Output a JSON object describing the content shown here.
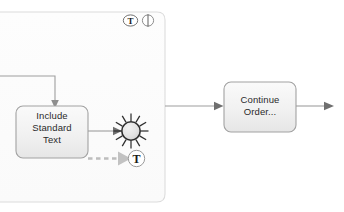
{
  "diagram": {
    "type": "workflow-bpmn",
    "background_color": "#ffffff",
    "container": {
      "name": "subprocess-container",
      "fill": "#fcfcfc",
      "stroke": "#d8d8d8",
      "markers": [
        {
          "id": "text-annotation-marker",
          "glyph": "T",
          "label": "T"
        },
        {
          "id": "attachment-marker",
          "glyph": "⏐",
          "label": ""
        }
      ]
    },
    "nodes": [
      {
        "id": "include-standard-text",
        "name": "include-standard-text-node",
        "label": "Include\nStandard\nText",
        "shape": "rounded-rect",
        "fill": "#f2f2f2",
        "stroke": "#9a9a9a"
      },
      {
        "id": "burst-event",
        "name": "burst-event-node",
        "label": "",
        "shape": "starburst",
        "fill": "#e0e0e0",
        "stroke": "#2b2b2b",
        "ray_count": 12
      },
      {
        "id": "burst-text-marker",
        "name": "burst-text-marker",
        "label": "T",
        "shape": "circle-glyph",
        "fill": "#ffffff",
        "stroke": "#8a8a8a"
      },
      {
        "id": "continue-order",
        "name": "continue-order-node",
        "label": "Continue\nOrder...",
        "shape": "rounded-rect",
        "fill": "#f2f2f2",
        "stroke": "#9a9a9a"
      }
    ],
    "connectors": [
      {
        "id": "inbound-elbow",
        "name": "inbound-elbow-connector",
        "style": "solid",
        "color": "#8f8f8f",
        "label": ""
      },
      {
        "id": "include-to-burst",
        "name": "include-to-burst-connector",
        "style": "solid",
        "color": "#8f8f8f",
        "label": ""
      },
      {
        "id": "include-to-text-marker",
        "name": "include-to-text-marker-connector",
        "style": "dashed",
        "color": "#b5b5b5",
        "label": ""
      },
      {
        "id": "container-to-continue",
        "name": "container-to-continue-connector",
        "style": "solid",
        "color": "#8f8f8f",
        "label": ""
      },
      {
        "id": "continue-outbound",
        "name": "continue-outbound-connector",
        "style": "solid",
        "color": "#8f8f8f",
        "label": ""
      }
    ]
  }
}
